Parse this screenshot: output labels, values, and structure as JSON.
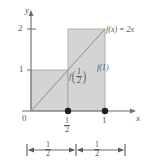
{
  "figure": {
    "kind": "math-graph",
    "colors": {
      "fill": "#d4d4d4",
      "stroke": "#58585a",
      "axis": "#6b6b6d",
      "dot": "#231f20",
      "background": "#ffffff"
    }
  },
  "axes": {
    "y_label": "y",
    "x_label": "x",
    "origin_label": "0",
    "y_ticks": [
      {
        "value": 1,
        "label": "1"
      },
      {
        "value": 2,
        "label": "2"
      }
    ],
    "x_ticks": [
      {
        "value": 0.5,
        "num": "1",
        "den": "2"
      },
      {
        "value": 1,
        "label": "1"
      }
    ],
    "xlim": [
      0,
      1.18
    ],
    "ylim": [
      0,
      2.3
    ]
  },
  "curve": {
    "label": "f(x) = 2x",
    "expression_parts": {
      "fx": "f(x)",
      "eq": "=",
      "rhs": "2x"
    },
    "from": {
      "x": 0,
      "y": 0
    },
    "to": {
      "x": 1,
      "y": 2
    }
  },
  "bars": [
    {
      "x_start": 0,
      "x_end": 0.5,
      "height": 1,
      "label_fn": "f",
      "label_num": "1",
      "label_den": "2"
    },
    {
      "x_start": 0.5,
      "x_end": 1,
      "height": 2,
      "label": "f(1)"
    }
  ],
  "point_labels": {
    "f_half_fn": "f",
    "f_half_num": "1",
    "f_half_den": "2",
    "f_one": "f(1)"
  },
  "points": [
    {
      "x": 0.5,
      "y": 0
    },
    {
      "x": 1,
      "y": 0
    }
  ],
  "dimension_bar": {
    "segments": [
      {
        "num": "1",
        "den": "2"
      },
      {
        "num": "1",
        "den": "2"
      }
    ]
  }
}
